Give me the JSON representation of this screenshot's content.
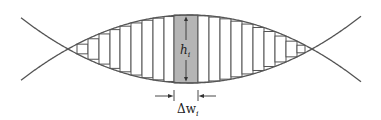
{
  "diagram": {
    "colors": {
      "curve": "#555555",
      "rect_fill": "#ffffff",
      "shaded_fill": "#b5b5b5",
      "stroke": "#555555",
      "text": "#222222"
    },
    "region": {
      "left_intersection": [
        68,
        49
      ],
      "right_intersection": [
        312,
        49
      ],
      "center_x": 190,
      "mid_y": 49,
      "top_y_at_center": 15,
      "half_height_at_center": 34
    },
    "rect_edges": [
      68,
      77,
      88,
      99,
      110,
      120,
      131,
      142,
      153,
      164,
      174,
      198,
      209,
      220,
      231,
      242,
      253,
      264,
      275,
      286,
      297,
      305,
      312
    ],
    "representative_rect": {
      "x0": 174,
      "x1": 198
    },
    "labels": {
      "height": "h",
      "height_sub": "i",
      "width": "Δw",
      "width_sub": "i"
    }
  }
}
